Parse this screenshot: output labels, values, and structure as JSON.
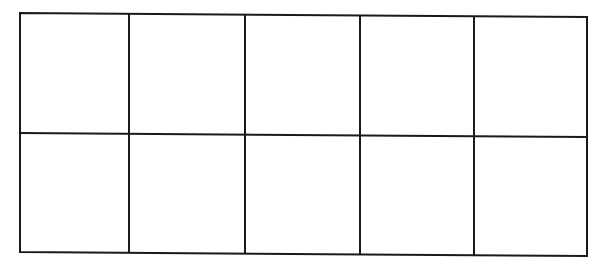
{
  "diagram": {
    "type": "grid",
    "rows": 2,
    "columns": 5,
    "cells": [
      [
        "",
        "",
        "",
        "",
        ""
      ],
      [
        "",
        "",
        "",
        "",
        ""
      ]
    ],
    "line_color": "#1a1a1a",
    "background": "#ffffff"
  }
}
